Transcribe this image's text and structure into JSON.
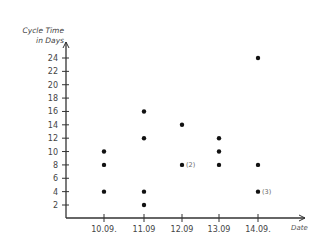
{
  "chart_data": {
    "type": "scatter",
    "title": "",
    "xlabel": "Date",
    "ylabel": "Cycle Time in Days",
    "categories": [
      "10.09.",
      "11.09",
      "12.09",
      "13.09",
      "14.09."
    ],
    "y_ticks": [
      2,
      4,
      6,
      8,
      10,
      12,
      14,
      16,
      18,
      20,
      22,
      24
    ],
    "ylim": [
      0,
      26
    ],
    "grid": false,
    "legend": null,
    "points": [
      {
        "x": "10.09.",
        "y": 10
      },
      {
        "x": "10.09.",
        "y": 8
      },
      {
        "x": "10.09.",
        "y": 4
      },
      {
        "x": "11.09",
        "y": 16
      },
      {
        "x": "11.09",
        "y": 12
      },
      {
        "x": "11.09",
        "y": 4
      },
      {
        "x": "11.09",
        "y": 2
      },
      {
        "x": "12.09",
        "y": 14
      },
      {
        "x": "12.09",
        "y": 8,
        "count": 2,
        "annotation": "(2)"
      },
      {
        "x": "13.09",
        "y": 12
      },
      {
        "x": "13.09",
        "y": 10
      },
      {
        "x": "13.09",
        "y": 8
      },
      {
        "x": "14.09.",
        "y": 24
      },
      {
        "x": "14.09.",
        "y": 8
      },
      {
        "x": "14.09.",
        "y": 4,
        "count": 3,
        "annotation": "(3)"
      }
    ]
  },
  "labels": {
    "ylabel_line1": "Cycle Time",
    "ylabel_line2": "in Days",
    "xlabel": "Date"
  },
  "colors": {
    "axis": "#333333",
    "dot": "#111111",
    "text": "#444444"
  }
}
